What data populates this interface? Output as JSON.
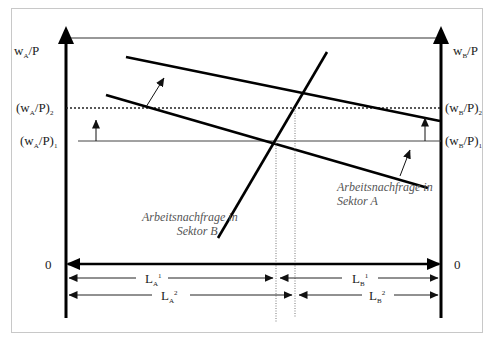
{
  "diagram": {
    "type": "labor-market-two-sector",
    "left_axis": {
      "label_main": "w",
      "label_sub": "A",
      "label_tail": "/P",
      "origin": "0"
    },
    "right_axis": {
      "label_main": "w",
      "label_sub": "B",
      "label_tail": "/P",
      "origin": "0"
    },
    "wage_levels": {
      "left_level2": {
        "pre": "(w",
        "sub": "A",
        "post": "/P)",
        "idx": "2"
      },
      "left_level1": {
        "pre": "(w",
        "sub": "A",
        "post": "/P)",
        "idx": "1"
      },
      "right_level2": {
        "pre": "(w",
        "sub": "B",
        "post": "/P)",
        "idx": "2"
      },
      "right_level1": {
        "pre": "(w",
        "sub": "B",
        "post": "/P)",
        "idx": "1"
      }
    },
    "curves": {
      "sector_a_label_line1": "Arbeitsnachfrage in",
      "sector_a_label_line2": "Sektor A",
      "sector_b_label_line1": "Arbeitsnachfrage in",
      "sector_b_label_line2": "Sektor B"
    },
    "employment": {
      "la1": {
        "main": "L",
        "sub": "A",
        "sup": "1"
      },
      "la2": {
        "main": "L",
        "sub": "A",
        "sup": "2"
      },
      "lb1": {
        "main": "L",
        "sub": "B",
        "sup": "1"
      },
      "lb2": {
        "main": "L",
        "sub": "B",
        "sup": "2"
      }
    }
  }
}
